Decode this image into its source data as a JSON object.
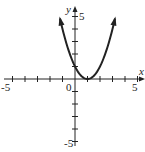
{
  "chart_data": {
    "type": "line",
    "title": "",
    "function": "y = (x - 1)^2",
    "xlabel": "x",
    "ylabel": "y",
    "xlim": [
      -5,
      5
    ],
    "ylim": [
      -5,
      5
    ],
    "grid": false,
    "tick_step": 1,
    "x_tick_labels": [
      "-5",
      "5"
    ],
    "y_tick_labels": [
      "5",
      "-5"
    ],
    "origin_label": "0",
    "series": [
      {
        "name": "parabola",
        "x": [
          -1.2,
          -1,
          0,
          1,
          2,
          3,
          3.2
        ],
        "y": [
          4.84,
          4,
          1,
          0,
          1,
          4,
          4.84
        ]
      }
    ],
    "vertex": [
      1,
      0
    ],
    "arrows_on_ends": true
  },
  "labels": {
    "x_axis": "x",
    "y_axis": "y",
    "x_min": "-5",
    "x_max": "5",
    "y_max": "5",
    "y_min": "-5",
    "origin": "0"
  }
}
